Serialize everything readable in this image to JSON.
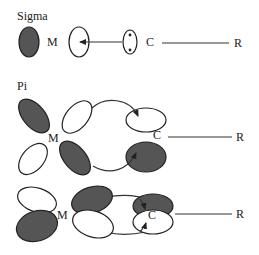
{
  "sections": {
    "sigma": {
      "title": "Sigma",
      "metal": "M",
      "carbon": "C",
      "r_group": "R"
    },
    "pi": {
      "title": "Pi",
      "metal": "M",
      "carbon": "C",
      "r_group": "R"
    },
    "delta": {
      "metal": "M",
      "carbon": "C",
      "r_group": "R"
    }
  },
  "colors": {
    "shaded_lobe": "#555555",
    "outline": "#222222",
    "background": "#ffffff"
  }
}
